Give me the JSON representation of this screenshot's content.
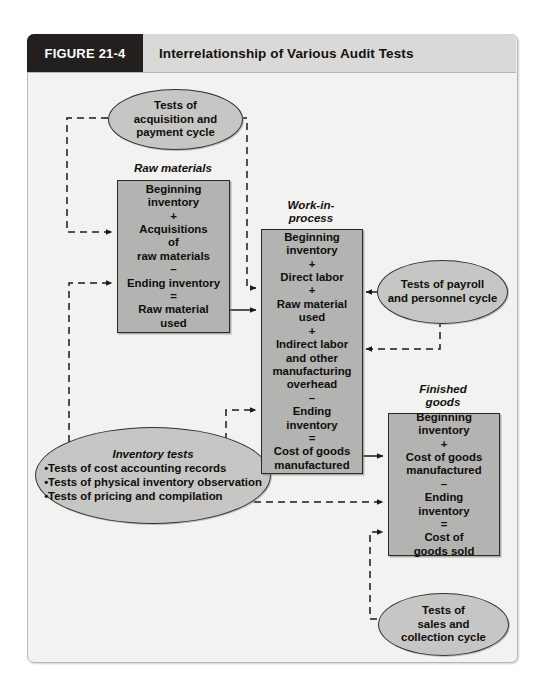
{
  "figure": {
    "tag": "FIGURE 21-4",
    "title": "Interrelationship of Various Audit Tests"
  },
  "ovals": {
    "acquisition": {
      "name": "tests-of-acquisition-and-payment-cycle",
      "lines": [
        "Tests of",
        "acquisition and",
        "payment cycle"
      ]
    },
    "payroll": {
      "name": "tests-of-payroll-and-personnel-cycle",
      "lines": [
        "Tests of payroll",
        "and personnel cycle"
      ]
    },
    "sales": {
      "name": "tests-of-sales-and-collection-cycle",
      "lines": [
        "Tests of",
        "sales and",
        "collection cycle"
      ]
    },
    "inventory": {
      "name": "inventory-tests",
      "heading": "Inventory tests",
      "items": [
        "•Tests of cost accounting records",
        "•Tests of physical inventory observation",
        "•Tests of pricing and compilation"
      ]
    }
  },
  "boxes": {
    "raw_materials": {
      "caption": "Raw materials",
      "lines": [
        "Beginning",
        "inventory",
        "+",
        "Acquisitions",
        "of",
        "raw materials",
        "–",
        "Ending inventory",
        "=",
        "Raw material",
        "used"
      ]
    },
    "work_in_process": {
      "caption": "Work-in-\nprocess",
      "caption_l1": "Work-in-",
      "caption_l2": "process",
      "lines": [
        "Beginning",
        "inventory",
        "+",
        "Direct labor",
        "+",
        "Raw material",
        "used",
        "+",
        "Indirect labor",
        "and other",
        "manufacturing",
        "overhead",
        "–",
        "Ending",
        "inventory",
        "=",
        "Cost of goods",
        "manufactured"
      ]
    },
    "finished_goods": {
      "caption_l1": "Finished",
      "caption_l2": "goods",
      "lines": [
        "Beginning inventory",
        "+",
        "Cost  of goods",
        "manufactured",
        "–",
        "Ending",
        "inventory",
        "=",
        "Cost of",
        "goods sold"
      ]
    }
  },
  "colors": {
    "tag_bg": "#231f1e",
    "title_bg": "#d9d9d7",
    "panel_bg": "#f2f2f0",
    "box_fill": "#b3b3b1",
    "oval_fill": "#c6c6c4",
    "stroke": "#2a2723"
  }
}
